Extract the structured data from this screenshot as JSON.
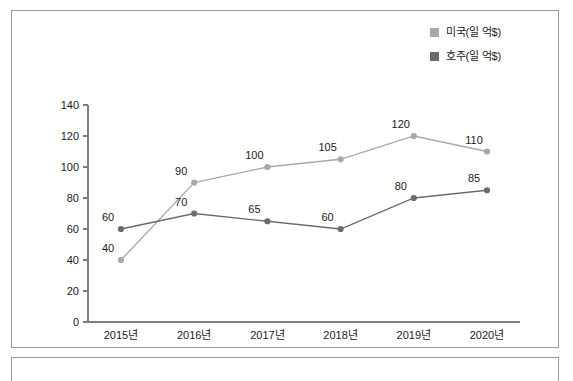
{
  "chart_data": {
    "type": "line",
    "title": "",
    "xlabel": "",
    "ylabel": "",
    "categories": [
      "2015년",
      "2016년",
      "2017년",
      "2018년",
      "2019년",
      "2020년"
    ],
    "ylim": [
      0,
      140
    ],
    "yticks": [
      0,
      20,
      40,
      60,
      80,
      100,
      120,
      140
    ],
    "grid": false,
    "legend_position": "top-right",
    "series": [
      {
        "name": "미국(일 억$)",
        "color": "#a8a8a8",
        "values": [
          40,
          90,
          100,
          105,
          120,
          110
        ],
        "labels": [
          "40",
          "90",
          "100",
          "105",
          "120",
          "110"
        ]
      },
      {
        "name": "호주(일 억$)",
        "color": "#6b6b6b",
        "values": [
          60,
          70,
          65,
          60,
          80,
          85
        ],
        "labels": [
          "60",
          "70",
          "65",
          "60",
          "80",
          "85"
        ]
      }
    ]
  },
  "legend": {
    "items": [
      {
        "label": "미국(일 억$)",
        "color": "#a8a8a8"
      },
      {
        "label": "호주(일 억$)",
        "color": "#6b6b6b"
      }
    ]
  },
  "axis": {
    "y_tick_labels": [
      "140",
      "120",
      "100",
      "80",
      "60",
      "40",
      "20",
      "0"
    ],
    "x_tick_labels": [
      "2015년",
      "2016년",
      "2017년",
      "2018년",
      "2019년",
      "2020년"
    ]
  },
  "colors": {
    "frame": "#9a9a9a",
    "axis": "#7d7d7d",
    "series_us": "#a8a8a8",
    "series_au": "#6b6b6b",
    "text": "#1a1a1a"
  }
}
